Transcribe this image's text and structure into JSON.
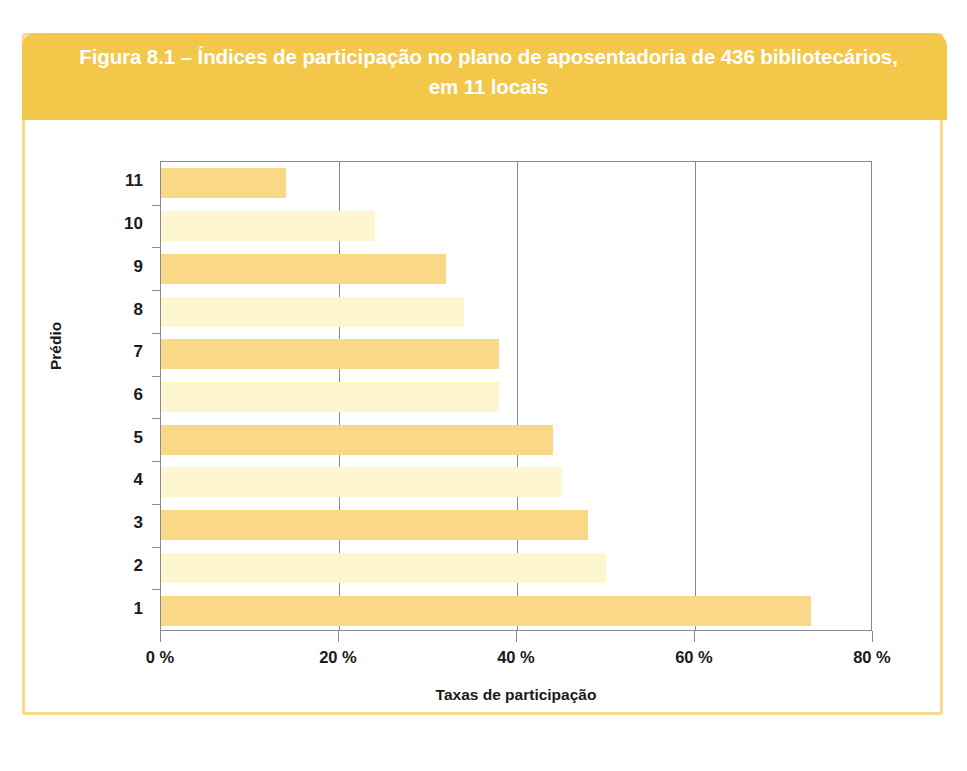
{
  "figure": {
    "caption": "Figura 8.1 – Índices de participação no plano de aposentadoria de 436 bibliotecários,\nem 11 locais",
    "band_color": "#F2C74A",
    "border_color": "#F5D98C"
  },
  "chart_data": {
    "type": "bar",
    "orientation": "horizontal",
    "title": "Figura 8.1 – Índices de participação no plano de aposentadoria de 436 bibliotecários, em 11 locais",
    "xlabel": "Taxas de participação",
    "ylabel": "Prédio",
    "categories": [
      "1",
      "2",
      "3",
      "4",
      "5",
      "6",
      "7",
      "8",
      "9",
      "10",
      "11"
    ],
    "values": [
      73,
      50,
      48,
      45,
      44,
      38,
      38,
      34,
      32,
      24,
      14
    ],
    "series": [
      {
        "name": "Taxas de participação",
        "values": [
          73,
          50,
          48,
          45,
          44,
          38,
          38,
          34,
          32,
          24,
          14
        ]
      }
    ],
    "xlim": [
      0,
      80
    ],
    "xticks": [
      0,
      20,
      40,
      60,
      80
    ],
    "xtick_labels": [
      "0 %",
      "20 %",
      "40 %",
      "60 %",
      "80 %"
    ],
    "grid": true,
    "grid_axis": "x",
    "legend": false,
    "bar_colors": [
      "#F9D987",
      "#FDF6CF"
    ],
    "bar_color_rule": "alternating by building, odd buildings darker gold",
    "units": "percent"
  }
}
